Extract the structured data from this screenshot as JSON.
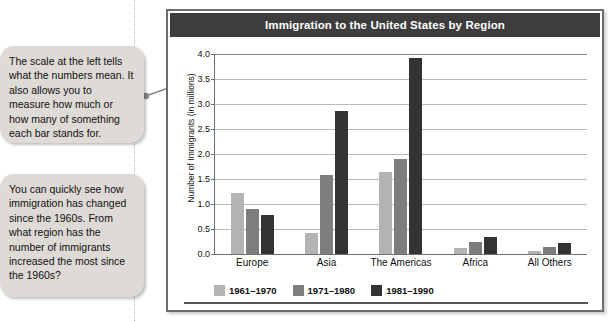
{
  "callouts": [
    {
      "id": "scale-callout",
      "text": "The scale at the left tells what the numbers mean. It also allows you to measure how much or how many of something each bar stands for."
    },
    {
      "id": "question-callout",
      "text": "You can quickly see how immigration has changed since the 1960s. From what region has the number of immigrants increased the most since the 1960s?"
    }
  ],
  "chart_data": {
    "type": "bar",
    "title": "Immigration to the United States by Region",
    "xlabel": "",
    "ylabel": "Number of Immigrants (in millions)",
    "categories": [
      "Europe",
      "Asia",
      "The Americas",
      "Africa",
      "All Others"
    ],
    "series": [
      {
        "name": "1961–1970",
        "color": "#b3b3b3",
        "values": [
          1.23,
          0.43,
          1.65,
          0.13,
          0.06
        ]
      },
      {
        "name": "1971–1980",
        "color": "#7d7d7d",
        "values": [
          0.9,
          1.59,
          1.91,
          0.25,
          0.15
        ]
      },
      {
        "name": "1981–1990",
        "color": "#333333",
        "values": [
          0.78,
          2.86,
          3.92,
          0.35,
          0.22
        ]
      }
    ],
    "ylim": [
      0.0,
      4.0
    ],
    "ytick_labels": [
      "0.0",
      "0.5",
      "1.0",
      "1.5",
      "2.0",
      "2.5",
      "3.0",
      "3.5",
      "4.0"
    ],
    "ytick_values": [
      0.0,
      0.5,
      1.0,
      1.5,
      2.0,
      2.5,
      3.0,
      3.5,
      4.0
    ],
    "grid": true,
    "legend_position": "bottom-left"
  },
  "colors": {
    "title_bar": "#3d3d3d",
    "callout_bg": "#dedad6",
    "panel_border": "#6d6d6d",
    "series_light": "#b3b3b3",
    "series_medium": "#7d7d7d",
    "series_dark": "#333333"
  }
}
